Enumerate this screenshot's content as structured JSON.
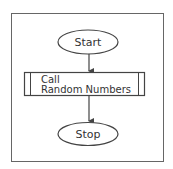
{
  "diagram": {
    "type": "flowchart",
    "nodes": [
      {
        "id": "start",
        "shape": "terminator",
        "label": "Start"
      },
      {
        "id": "call",
        "shape": "predefined-process",
        "label_line1": "Call",
        "label_line2": "Random Numbers"
      },
      {
        "id": "stop",
        "shape": "terminator",
        "label": "Stop"
      }
    ],
    "edges": [
      {
        "from": "start",
        "to": "call"
      },
      {
        "from": "call",
        "to": "stop"
      }
    ]
  },
  "colors": {
    "stroke": "#444444",
    "frame": "#666666",
    "background": "#ffffff"
  }
}
